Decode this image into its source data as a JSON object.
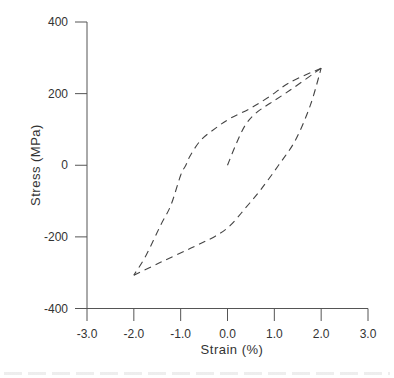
{
  "chart_data": {
    "type": "line",
    "title": "",
    "xlabel": "Strain (%)",
    "ylabel": "Stress (MPa)",
    "xlim": [
      -3.0,
      3.0
    ],
    "ylim": [
      -400,
      400
    ],
    "x_ticks": [
      "-3.0",
      "-2.0",
      "-1.0",
      "0.0",
      "1.0",
      "2.0",
      "3.0"
    ],
    "y_ticks": [
      "400",
      "200",
      "0",
      "-200",
      "-400"
    ],
    "grid": false,
    "legend": null,
    "line_style": "dashed",
    "series": [
      {
        "name": "initial loading",
        "x": [
          0.0,
          0.19,
          0.38,
          0.6,
          0.91,
          1.34,
          2.0
        ],
        "y": [
          0,
          61,
          112,
          145,
          173,
          210,
          271
        ]
      },
      {
        "name": "reverse loading",
        "x": [
          2.0,
          1.34,
          0.91,
          0.49,
          0.06,
          -0.26,
          -0.57,
          -0.79,
          -0.89,
          -1.0,
          -1.21,
          -1.43,
          -1.74,
          -2.0
        ],
        "y": [
          271,
          232,
          193,
          159,
          131,
          103,
          70,
          28,
          0,
          -28,
          -112,
          -168,
          -252,
          -307
        ]
      },
      {
        "name": "reloading",
        "x": [
          -2.0,
          -1.43,
          -0.79,
          -0.26,
          0.06,
          0.38,
          0.7,
          1.09,
          1.45,
          1.77,
          2.0
        ],
        "y": [
          -307,
          -271,
          -232,
          -198,
          -168,
          -120,
          -70,
          0,
          70,
          168,
          271
        ]
      }
    ]
  }
}
